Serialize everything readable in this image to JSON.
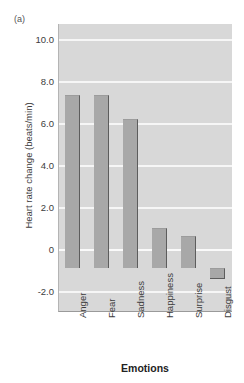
{
  "figure": {
    "panel_label": "(a)"
  },
  "chart_data": {
    "type": "bar",
    "title": "",
    "subtitle": "",
    "panel": "(a)",
    "categories": [
      "Anger",
      "Fear",
      "Sadness",
      "Happiness",
      "Surprise",
      "Disgust"
    ],
    "values": [
      7.8,
      7.8,
      6.7,
      1.8,
      1.45,
      -0.5
    ],
    "series": [
      {
        "name": "Heart rate change",
        "values": [
          7.8,
          7.8,
          6.7,
          1.8,
          1.45,
          -0.5
        ]
      }
    ],
    "xlabel": "Emotions",
    "ylabel": "Heart rate change (beats/min)",
    "ylim": [
      -2.0,
      11.0
    ],
    "yticks": [
      10.0,
      8.0,
      6.0,
      4.0,
      2.0,
      0,
      -2.0
    ],
    "ytick_labels": [
      "10.0",
      "8.0",
      "6.0",
      "4.0",
      "2.0",
      "0",
      "-2.0"
    ],
    "grid": true,
    "grid_color": "#f6f6f6",
    "legend": null,
    "legend_position": "none",
    "bar_color": "#a8a8a8",
    "bar_edge_color": "#5d5d5d",
    "plot_background": "#d8d8d8",
    "figure_background": "#ffffff",
    "xtick_rotation": 90,
    "annotations": []
  }
}
